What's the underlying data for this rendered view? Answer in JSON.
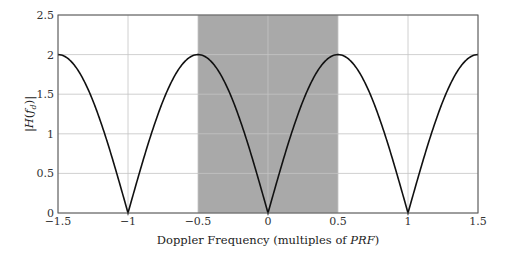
{
  "chart_data": {
    "type": "line",
    "title": "",
    "xlabel": "Doppler Frequency (multiples of PRF)",
    "xlabel_parts": {
      "prefix": "Doppler Frequency (multiples of ",
      "italic": "PRF",
      "suffix": ")"
    },
    "ylabel": "|H(f_d)|",
    "xlim": [
      -1.5,
      1.5
    ],
    "ylim": [
      0,
      2.5
    ],
    "xticks": [
      -1.5,
      -1,
      -0.5,
      0,
      0.5,
      1,
      1.5
    ],
    "xtick_labels": [
      "−1.5",
      "−1",
      "−0.5",
      "0",
      "0.5",
      "1",
      "1.5"
    ],
    "yticks": [
      0,
      0.5,
      1,
      1.5,
      2,
      2.5
    ],
    "ytick_labels": [
      "0",
      "0.5",
      "1",
      "1.5",
      "2",
      "2.5"
    ],
    "grid": true,
    "legend": null,
    "shaded_region": {
      "x0": -0.5,
      "x1": 0.5,
      "color": "#a9a9a9"
    },
    "series": [
      {
        "name": "|H(f_d)| = 2|sin(π f_d / PRF)|",
        "function": "2*abs(sin(pi*x))",
        "color": "#111111",
        "x": [
          -1.5,
          -1.25,
          -1.0,
          -0.75,
          -0.5,
          -0.25,
          0.0,
          0.25,
          0.5,
          0.75,
          1.0,
          1.25,
          1.5
        ],
        "y": [
          2.0,
          1.414,
          0.0,
          1.414,
          2.0,
          1.414,
          0.0,
          1.414,
          2.0,
          1.414,
          0.0,
          1.414,
          2.0
        ]
      }
    ]
  },
  "layout": {
    "plot_left": 58,
    "plot_right": 478,
    "plot_top": 15,
    "plot_bottom": 213
  }
}
